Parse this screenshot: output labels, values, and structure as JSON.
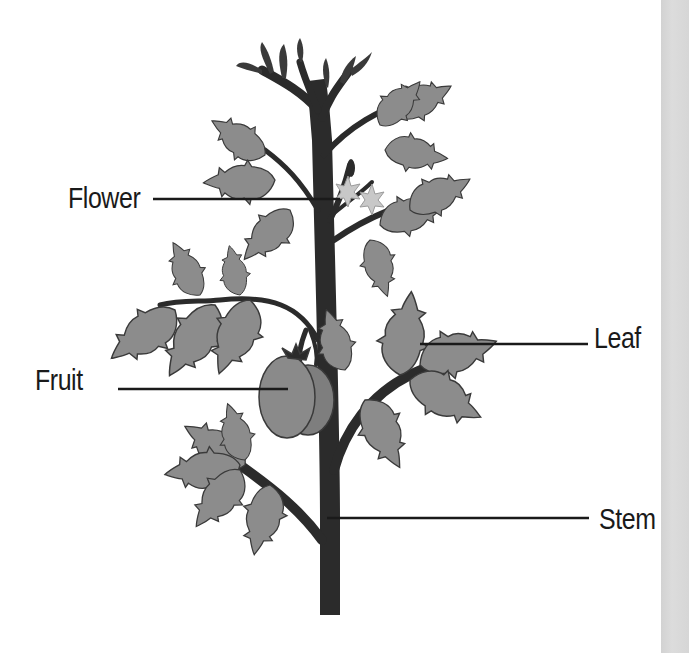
{
  "diagram": {
    "labels": [
      {
        "id": "flower",
        "text": "Flower",
        "x": 68,
        "y": 184,
        "line": {
          "x1": 153,
          "y1": 199,
          "x2": 340,
          "y2": 199
        }
      },
      {
        "id": "fruit",
        "text": "Fruit",
        "x": 35,
        "y": 366,
        "line": {
          "x1": 118,
          "y1": 389,
          "x2": 288,
          "y2": 389
        }
      },
      {
        "id": "leaf",
        "text": "Leaf",
        "x": 594,
        "y": 324,
        "line": {
          "x1": 420,
          "y1": 344,
          "x2": 588,
          "y2": 344
        }
      },
      {
        "id": "stem",
        "text": "Stem",
        "x": 599,
        "y": 505,
        "line": {
          "x1": 327,
          "y1": 518,
          "x2": 589,
          "y2": 518
        }
      }
    ],
    "colors": {
      "background": "#ffffff",
      "side_strip": "#d8d8d8",
      "stem": "#2b2b2b",
      "leaf_fill": "#8c8c8c",
      "leaf_dark": "#6f6f6f",
      "leaf_outline": "#3a3a3a",
      "fruit_fill": "#8a8a8a",
      "flower_fill": "#c8c8c8",
      "leader_line": "#1a1a1a",
      "text": "#1a1a1a"
    }
  }
}
